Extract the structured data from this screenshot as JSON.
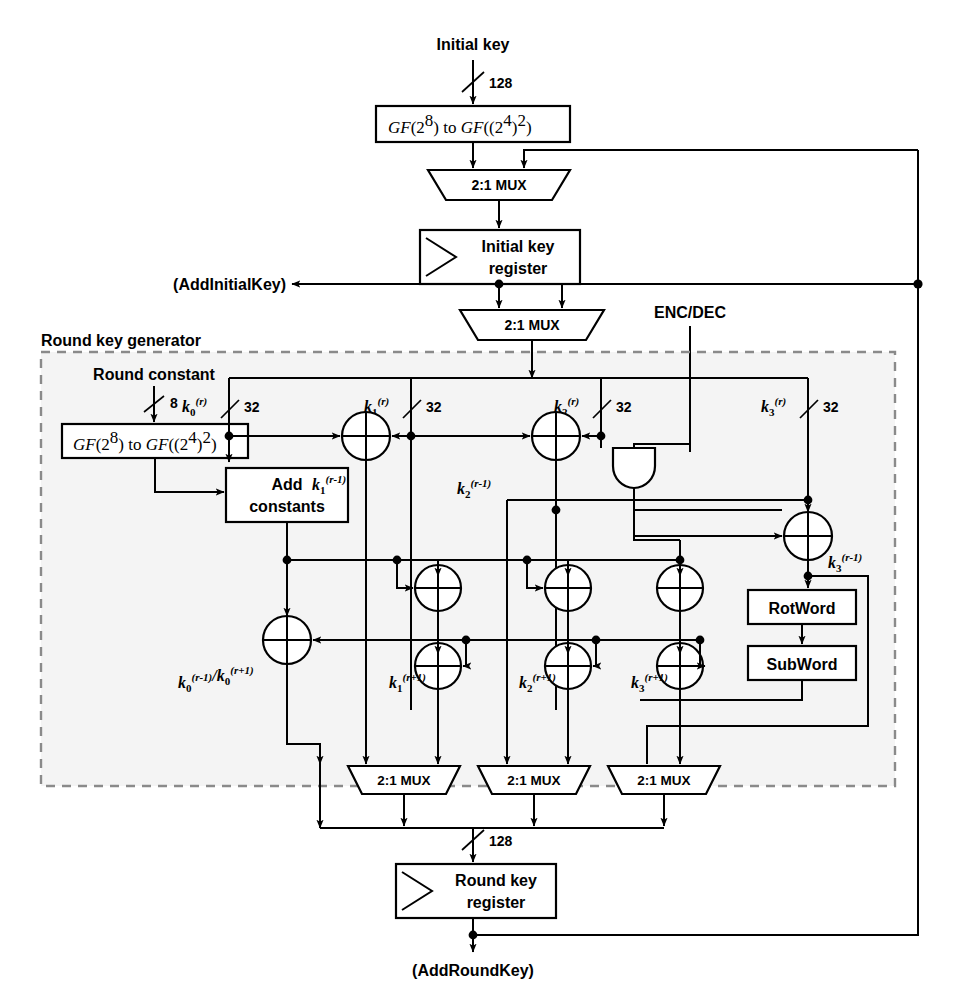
{
  "diagram": {
    "group_label": "Round key generator"
  },
  "signals": {
    "initial_key": "Initial key",
    "round_constant": "Round constant",
    "enc_dec": "ENC/DEC",
    "add_initial_key": "(AddInitialKey)",
    "add_round_key": "(AddRoundKey)"
  },
  "widths": {
    "w128_top": "128",
    "w8": "8",
    "w128_bottom": "128",
    "w32": "32"
  },
  "blocks": {
    "gf_convert_top": {
      "pre": "GF",
      "a": "(2",
      "a_sup": "8",
      "mid": ") to ",
      "pre2": "GF",
      "b": "((2",
      "b_sup": "4",
      "b_close": ")",
      "b_sup2": "2",
      "tail": ")"
    },
    "gf_convert_round": {
      "pre": "GF",
      "a": "(2",
      "a_sup": "8",
      "mid": ") to ",
      "pre2": "GF",
      "b": "((2",
      "b_sup": "4",
      "b_close": ")",
      "b_sup2": "2",
      "tail": ")"
    },
    "initial_key_register_l1": "Initial key",
    "initial_key_register_l2": "register",
    "round_key_register_l1": "Round key",
    "round_key_register_l2": "register",
    "add_constants_l1": "Add",
    "add_constants_l2": "constants",
    "rotword": "RotWord",
    "subword": "SubWord",
    "mux_label": "2:1 MUX"
  },
  "muxes": [
    {
      "id": "mux-top-initial",
      "label": "2:1 MUX"
    },
    {
      "id": "mux-initial-out",
      "label": "2:1 MUX"
    },
    {
      "id": "mux-k1",
      "label": "2:1 MUX"
    },
    {
      "id": "mux-k2",
      "label": "2:1 MUX"
    },
    {
      "id": "mux-k3",
      "label": "2:1 MUX"
    }
  ],
  "key_labels": {
    "k0_r": {
      "base": "k",
      "sub": "0",
      "sup": "(r)"
    },
    "k1_r": {
      "base": "k",
      "sub": "1",
      "sup": "(r)"
    },
    "k2_r": {
      "base": "k",
      "sub": "2",
      "sup": "(r)"
    },
    "k3_r": {
      "base": "k",
      "sub": "3",
      "sup": "(r)"
    },
    "k1_rm1": {
      "base": "k",
      "sub": "1",
      "sup": "(r-1)"
    },
    "k2_rm1": {
      "base": "k",
      "sub": "2",
      "sup": "(r-1)"
    },
    "k3_rm1": {
      "base": "k",
      "sub": "3",
      "sup": "(r-1)"
    },
    "k0_mux": {
      "base": "k",
      "sub": "0",
      "sup": "(r-1)",
      "sep": "/",
      "base2": "k",
      "sub2": "0",
      "sup2": "(r+1)"
    },
    "k1_rp1": {
      "base": "k",
      "sub": "1",
      "sup": "(r+1)"
    },
    "k2_rp1": {
      "base": "k",
      "sub": "2",
      "sup": "(r+1)"
    },
    "k3_rp1": {
      "base": "k",
      "sub": "3",
      "sup": "(r+1)"
    }
  },
  "colors": {
    "line": "#000000",
    "dashed_group": "#8a8a8a",
    "background": "#ffffff",
    "shade": "#ebebeb"
  }
}
